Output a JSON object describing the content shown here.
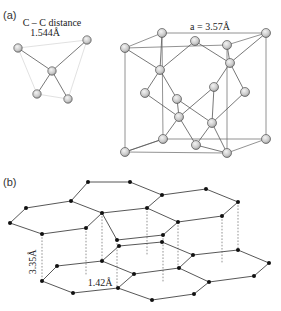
{
  "panel_a": {
    "label": "(a)",
    "tetrahedron": {
      "title_line1": "C – C distance",
      "title_line2": "1.544Å",
      "atoms": [
        [
          18,
          48
        ],
        [
          87,
          40
        ],
        [
          52,
          71
        ],
        [
          37,
          94
        ],
        [
          68,
          99
        ]
      ],
      "bonds": [
        [
          2,
          0
        ],
        [
          2,
          1
        ],
        [
          2,
          3
        ],
        [
          2,
          4
        ]
      ],
      "faint_edges": [
        [
          0,
          3
        ],
        [
          3,
          4
        ],
        [
          4,
          1
        ],
        [
          0,
          1
        ]
      ]
    },
    "cube": {
      "lattice_label": "a = 3.57Å",
      "back_face": [
        [
          162,
          33
        ],
        [
          266,
          33
        ],
        [
          266,
          139
        ],
        [
          163,
          139
        ]
      ],
      "front_face": [
        [
          125,
          48
        ],
        [
          227,
          45
        ],
        [
          227,
          153
        ],
        [
          125,
          152
        ]
      ],
      "atoms": [
        [
          162,
          33
        ],
        [
          266,
          33
        ],
        [
          125,
          48
        ],
        [
          195,
          41
        ],
        [
          227,
          45
        ],
        [
          230,
          63
        ],
        [
          160,
          70
        ],
        [
          145,
          93
        ],
        [
          214,
          87
        ],
        [
          245,
          92
        ],
        [
          177,
          99
        ],
        [
          179,
          117
        ],
        [
          212,
          123
        ],
        [
          163,
          139
        ],
        [
          196,
          145
        ],
        [
          266,
          139
        ],
        [
          125,
          152
        ],
        [
          227,
          153
        ]
      ],
      "bonds": [
        [
          2,
          6
        ],
        [
          0,
          6
        ],
        [
          3,
          6
        ],
        [
          6,
          7
        ],
        [
          6,
          10
        ],
        [
          4,
          5
        ],
        [
          1,
          5
        ],
        [
          3,
          5
        ],
        [
          5,
          8
        ],
        [
          5,
          9
        ],
        [
          7,
          11
        ],
        [
          10,
          11
        ],
        [
          11,
          13
        ],
        [
          11,
          14
        ],
        [
          8,
          11
        ],
        [
          8,
          12
        ],
        [
          9,
          12
        ],
        [
          12,
          14
        ],
        [
          12,
          17
        ],
        [
          13,
          16
        ],
        [
          14,
          17
        ],
        [
          10,
          12
        ]
      ]
    }
  },
  "panel_b": {
    "label": "(b)",
    "interlayer_distance": "3.35Å",
    "bond_length": "1.42Å",
    "top_layer_atoms": [
      [
        88,
        182
      ],
      [
        130,
        182
      ],
      [
        162,
        195
      ],
      [
        206,
        189
      ],
      [
        238,
        202
      ],
      [
        222,
        216
      ],
      [
        178,
        222
      ],
      [
        163,
        235
      ],
      [
        117,
        240
      ],
      [
        102,
        213
      ],
      [
        147,
        208
      ],
      [
        71,
        201
      ],
      [
        26,
        208
      ],
      [
        10,
        223
      ],
      [
        42,
        234
      ],
      [
        86,
        228
      ]
    ],
    "top_layer_bonds": [
      [
        0,
        1
      ],
      [
        1,
        2
      ],
      [
        2,
        3
      ],
      [
        3,
        4
      ],
      [
        4,
        5
      ],
      [
        5,
        6
      ],
      [
        6,
        7
      ],
      [
        7,
        8
      ],
      [
        8,
        9
      ],
      [
        9,
        10
      ],
      [
        10,
        2
      ],
      [
        10,
        6
      ],
      [
        9,
        15
      ],
      [
        15,
        14
      ],
      [
        14,
        13
      ],
      [
        13,
        12
      ],
      [
        12,
        11
      ],
      [
        11,
        9
      ],
      [
        0,
        11
      ]
    ],
    "bottom_layer_atoms": [
      [
        119,
        246
      ],
      [
        162,
        242
      ],
      [
        193,
        255
      ],
      [
        238,
        250
      ],
      [
        269,
        263
      ],
      [
        254,
        276
      ],
      [
        209,
        282
      ],
      [
        194,
        294
      ],
      [
        152,
        300
      ],
      [
        118,
        288
      ],
      [
        73,
        293
      ],
      [
        42,
        281
      ],
      [
        57,
        266
      ],
      [
        102,
        261
      ],
      [
        134,
        274
      ],
      [
        179,
        268
      ]
    ],
    "bottom_layer_bonds": [
      [
        0,
        1
      ],
      [
        1,
        2
      ],
      [
        2,
        3
      ],
      [
        3,
        4
      ],
      [
        4,
        5
      ],
      [
        5,
        6
      ],
      [
        6,
        7
      ],
      [
        6,
        15
      ],
      [
        15,
        2
      ],
      [
        15,
        14
      ],
      [
        14,
        13
      ],
      [
        13,
        0
      ],
      [
        13,
        12
      ],
      [
        12,
        11
      ],
      [
        11,
        10
      ],
      [
        10,
        9
      ],
      [
        9,
        14
      ],
      [
        9,
        8
      ],
      [
        8,
        7
      ]
    ],
    "dashed_connectors": [
      [
        42,
        234,
        42,
        281
      ],
      [
        86,
        228,
        86,
        276
      ],
      [
        102,
        213,
        102,
        261
      ],
      [
        117,
        240,
        117,
        288
      ],
      [
        147,
        208,
        147,
        256
      ],
      [
        163,
        235,
        163,
        283
      ],
      [
        178,
        222,
        178,
        268
      ],
      [
        222,
        216,
        222,
        264
      ],
      [
        238,
        202,
        238,
        250
      ]
    ]
  }
}
